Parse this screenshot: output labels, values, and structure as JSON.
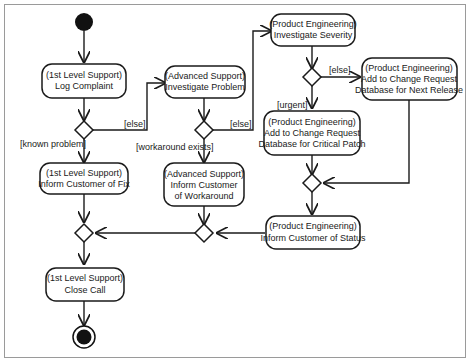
{
  "diagram": {
    "type": "UML activity diagram",
    "nodes": {
      "log_complaint": {
        "lines": [
          "(1st Level Support)",
          "Log Complaint"
        ]
      },
      "investigate_problem": {
        "lines": [
          "(Advanced Support)",
          "Investigate Problem"
        ]
      },
      "investigate_severity": {
        "lines": [
          "(Product Engineering)",
          "Investigate Severity"
        ]
      },
      "add_next_release": {
        "lines": [
          "(Product Engineering)",
          "Add to Change Request",
          "Database for Next Release"
        ]
      },
      "add_critical_patch": {
        "lines": [
          "(Product Engineering)",
          "Add to Change Request",
          "Database for Critical Patch"
        ]
      },
      "inform_fix": {
        "lines": [
          "(1st Level Support)",
          "Inform Customer of Fix"
        ]
      },
      "inform_workaround": {
        "lines": [
          "(Advanced Support)",
          "Inform Customer",
          "of Workaround"
        ]
      },
      "inform_status": {
        "lines": [
          "(Product Engineering)",
          "Inform Customer of Status"
        ]
      },
      "close_call": {
        "lines": [
          "(1st Level Support)",
          "Close Call"
        ]
      }
    },
    "guards": {
      "else_1": "[else]",
      "known_problem": "[known problem]",
      "else_2": "[else]",
      "workaround_exists": "[workaround exists]",
      "else_3": "[else]",
      "urgent": "[urgent]"
    },
    "colors": {
      "line": "#1a1a1a",
      "fill": "#ffffff",
      "frame": "#9a9a9a"
    }
  }
}
